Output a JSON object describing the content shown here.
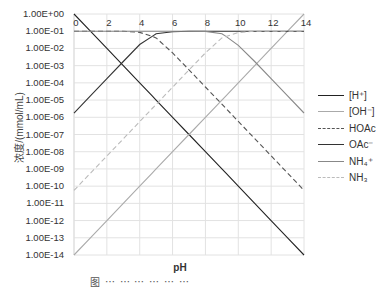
{
  "chart_data": {
    "type": "line",
    "title": "",
    "xlabel": "pH",
    "ylabel": "浓度/(mmol/mL)",
    "xlim": [
      0,
      14
    ],
    "ylim": [
      1e-14,
      1
    ],
    "yscale": "log",
    "grid": true,
    "legend_position": "right",
    "x_ticks": [
      "0",
      "2",
      "4",
      "6",
      "8",
      "10",
      "12",
      "14"
    ],
    "y_ticks": [
      "1.00E+00",
      "1.00E-01",
      "1.00E-02",
      "1.00E-03",
      "1.00E-04",
      "1.00E-05",
      "1.00E-06",
      "1.00E-07",
      "1.00E-08",
      "1.00E-09",
      "1.00E-10",
      "1.00E-11",
      "1.00E-12",
      "1.00E-13",
      "1.00E-14"
    ],
    "x": [
      0,
      1,
      2,
      3,
      4,
      4.76,
      5,
      6,
      7,
      8,
      9,
      9.25,
      10,
      11,
      12,
      13,
      14
    ],
    "series": [
      {
        "name": "[H⁺]",
        "style": "solid",
        "color": "#222222",
        "log10_values": [
          0,
          -1,
          -2,
          -3,
          -4,
          -4.76,
          -5,
          -6,
          -7,
          -8,
          -9,
          -9.25,
          -10,
          -11,
          -12,
          -13,
          -14
        ]
      },
      {
        "name": "[OH⁻]",
        "style": "solid",
        "color": "#aaaaaa",
        "log10_values": [
          -14,
          -13,
          -12,
          -11,
          -10,
          -9.24,
          -9,
          -8,
          -7,
          -6,
          -5,
          -4.75,
          -4,
          -3,
          -2,
          -1,
          0
        ]
      },
      {
        "name": "HOAc",
        "style": "dashed",
        "color": "#555555",
        "log10_values": [
          -1,
          -1,
          -1,
          -1,
          -1.07,
          -1.3,
          -1.39,
          -2.26,
          -3.24,
          -4.24,
          -5.24,
          -5.49,
          -6.24,
          -7.24,
          -8.24,
          -9.24,
          -10.24
        ]
      },
      {
        "name": "OAc⁻",
        "style": "solid",
        "color": "#333333",
        "log10_values": [
          -5.76,
          -4.76,
          -3.76,
          -2.76,
          -1.77,
          -1.3,
          -1.15,
          -1.03,
          -1,
          -1,
          -1,
          -1,
          -1,
          -1,
          -1,
          -1,
          -1
        ]
      },
      {
        "name": "NH₄⁺",
        "style": "solid",
        "color": "#888888",
        "log10_values": [
          -1,
          -1,
          -1,
          -1,
          -1,
          -1,
          -1,
          -1,
          -1,
          -1.01,
          -1.15,
          -1.3,
          -1.82,
          -2.76,
          -3.75,
          -4.75,
          -5.75
        ]
      },
      {
        "name": "NH₃",
        "style": "dashed",
        "color": "#bbbbbb",
        "log10_values": [
          -10.25,
          -9.25,
          -8.25,
          -7.25,
          -6.25,
          -5.49,
          -5.25,
          -4.25,
          -3.25,
          -2.26,
          -1.39,
          -1.3,
          -1.08,
          -1,
          -1,
          -1,
          -1
        ]
      }
    ]
  },
  "legend": [
    {
      "label": "[H⁺]"
    },
    {
      "label": "[OH⁻]"
    },
    {
      "label": "HOAc"
    },
    {
      "label": "OAc⁻"
    },
    {
      "label": "NH₄⁺"
    },
    {
      "label": "NH₃"
    }
  ],
  "caption": "图 ⋯ ⋯ ⋯ ⋯ ⋯ ⋯"
}
